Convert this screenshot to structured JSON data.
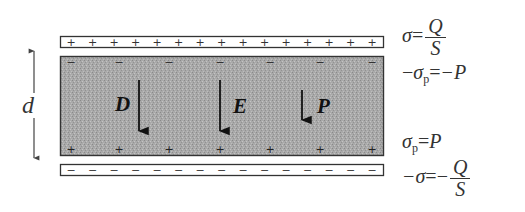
{
  "diagram": {
    "colors": {
      "plate_fill": "#ffffff",
      "plate_stroke": "#333333",
      "dielectric_fill": "#a8a8a8",
      "arrow": "#111111",
      "text": "#333333"
    },
    "separation_label": "d",
    "top_plate": {
      "charge_symbol": "+",
      "count": 15
    },
    "bottom_plate": {
      "charge_symbol": "−",
      "count": 15
    },
    "dielectric": {
      "top_surface_charge_symbol": "−",
      "bottom_surface_charge_symbol": "+"
    },
    "vectors": [
      {
        "label": "D",
        "direction": "down",
        "length": "long"
      },
      {
        "label": "E",
        "direction": "down",
        "length": "long"
      },
      {
        "label": "P",
        "direction": "down",
        "length": "short"
      }
    ],
    "equations": {
      "top_plate": {
        "lhs": "σ",
        "eq": "=",
        "num": "Q",
        "den": "S"
      },
      "dielectric_top": {
        "neg": "−",
        "sym": "σ",
        "sub": "p",
        "eq": "=",
        "rhs": "−P"
      },
      "dielectric_bottom": {
        "sym": "σ",
        "sub": "p",
        "eq": "=",
        "rhs": "P"
      },
      "bottom_plate": {
        "lhs": "−σ",
        "eq": "=",
        "neg": "−",
        "num": "Q",
        "den": "S"
      }
    }
  }
}
